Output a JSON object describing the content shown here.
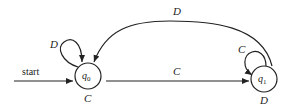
{
  "diagram": {
    "type": "finite-state-automaton",
    "start_label": "start",
    "states": [
      {
        "id": "q0",
        "name": "q",
        "subscript": "0",
        "cx": 88,
        "cy": 76,
        "r": 13,
        "below_label": "C"
      },
      {
        "id": "q1",
        "name": "q",
        "subscript": "1",
        "cx": 264,
        "cy": 79,
        "r": 13,
        "below_label": "D"
      }
    ],
    "transitions": [
      {
        "from": "start",
        "to": "q0",
        "label": "start"
      },
      {
        "from": "q0",
        "to": "q0",
        "label": "D",
        "kind": "self-loop"
      },
      {
        "from": "q0",
        "to": "q1",
        "label": "C",
        "kind": "straight"
      },
      {
        "from": "q1",
        "to": "q1",
        "label": "C",
        "kind": "self-loop"
      },
      {
        "from": "q1",
        "to": "q0",
        "label": "D",
        "kind": "arc"
      }
    ],
    "labels": {
      "q0_loop": "D",
      "q0_below": "C",
      "q0_to_q1": "C",
      "q1_loop": "C",
      "q1_below": "D",
      "q1_to_q0": "D"
    },
    "stroke_color": "#222222"
  }
}
